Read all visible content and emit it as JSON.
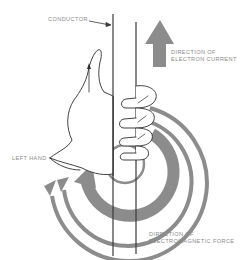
{
  "diagram": {
    "labels": {
      "conductor": "CONDUCTOR",
      "current_line1": "DIRECTION OF",
      "current_line2": "ELECTRON CURRENT",
      "hand": "LEFT HAND",
      "force_line1": "DIRECTION OF",
      "force_line2": "ELECTROMAGNETIC FORCE"
    },
    "colors": {
      "arrow_gray": "#8c8c8c",
      "line": "#3a3a3a",
      "text": "#8a8a8a"
    },
    "icons": [
      "current-direction-arrow-icon",
      "field-arc-arrow-icon",
      "left-hand-illustration"
    ]
  }
}
